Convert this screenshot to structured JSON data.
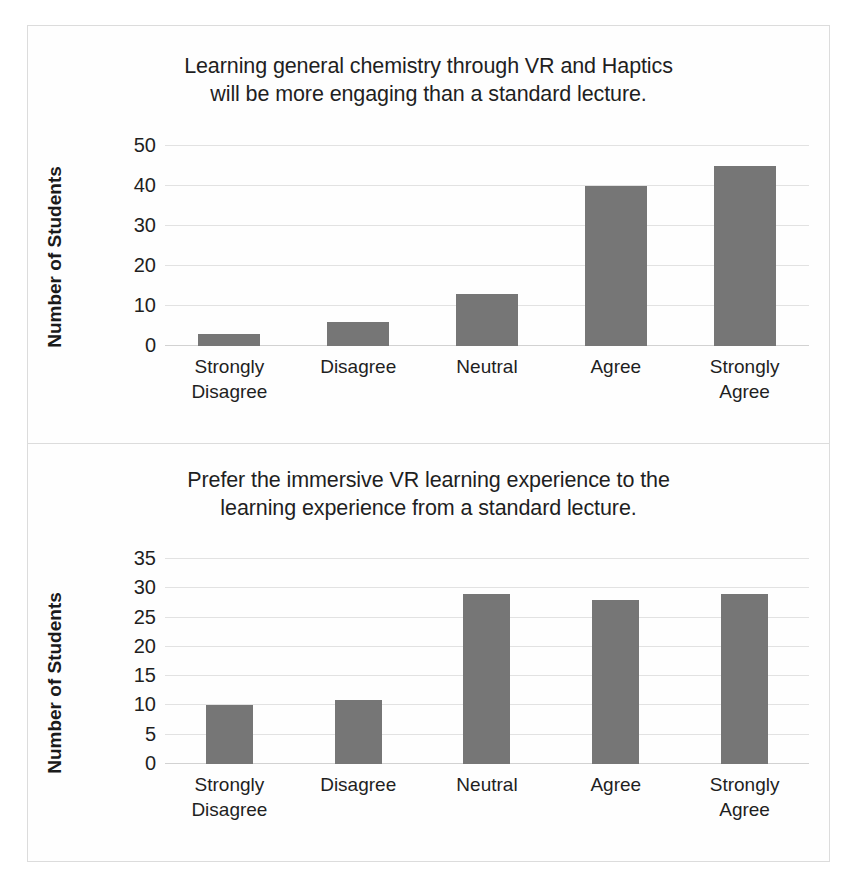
{
  "figure": {
    "panels": [
      {
        "id": "engagement",
        "title_line1": "Learning general chemistry through VR and Haptics",
        "title_line2": "will be more engaging than a standard lecture.",
        "ylabel": "Number of Students"
      },
      {
        "id": "preference",
        "title_line1": "Prefer the immersive VR learning experience to the",
        "title_line2": "learning experience from a standard lecture.",
        "ylabel": "Number of Students"
      }
    ]
  },
  "chart_data": [
    {
      "type": "bar",
      "title": "Learning general chemistry through VR and Haptics will be more engaging than a standard lecture.",
      "xlabel": "",
      "ylabel": "Number of Students",
      "categories": [
        "Strongly Disagree",
        "Disagree",
        "Neutral",
        "Agree",
        "Strongly Agree"
      ],
      "category_lines": [
        [
          "Strongly",
          "Disagree"
        ],
        [
          "Disagree",
          ""
        ],
        [
          "Neutral",
          ""
        ],
        [
          "Agree",
          ""
        ],
        [
          "Strongly",
          "Agree"
        ]
      ],
      "values": [
        3,
        6,
        13,
        40,
        45
      ],
      "ylim": [
        0,
        50
      ],
      "yticks": [
        0,
        10,
        20,
        30,
        40,
        50
      ],
      "grid": true,
      "legend": "none",
      "bar_color": "#767676"
    },
    {
      "type": "bar",
      "title": "Prefer the immersive VR learning experience to the learning experience from a standard lecture.",
      "xlabel": "",
      "ylabel": "Number of Students",
      "categories": [
        "Strongly Disagree",
        "Disagree",
        "Neutral",
        "Agree",
        "Strongly Agree"
      ],
      "category_lines": [
        [
          "Strongly",
          "Disagree"
        ],
        [
          "Disagree",
          ""
        ],
        [
          "Neutral",
          ""
        ],
        [
          "Agree",
          ""
        ],
        [
          "Strongly",
          "Agree"
        ]
      ],
      "values": [
        10,
        11,
        29,
        28,
        29
      ],
      "ylim": [
        0,
        35
      ],
      "yticks": [
        0,
        5,
        10,
        15,
        20,
        25,
        30,
        35
      ],
      "grid": true,
      "legend": "none",
      "bar_color": "#767676"
    }
  ]
}
